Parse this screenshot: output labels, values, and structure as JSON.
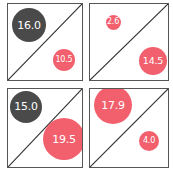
{
  "colors": {
    "dark": "#4a4a4a",
    "pink": "#f2606e",
    "border": "#555555",
    "label": "#ffffff"
  },
  "panels": [
    {
      "id": "top-left",
      "box": {
        "x": 7,
        "y": 3,
        "w": 76,
        "h": 78
      },
      "upper": {
        "value": "16.0",
        "color": "dark",
        "cx": 28,
        "cy": 24,
        "d": 34
      },
      "lower": {
        "value": "10.5",
        "color": "pink",
        "cx": 63,
        "cy": 59,
        "d": 22
      }
    },
    {
      "id": "top-right",
      "box": {
        "x": 89,
        "y": 3,
        "w": 80,
        "h": 78
      },
      "upper": {
        "value": "2.6",
        "color": "pink",
        "cx": 112,
        "cy": 21,
        "d": 15
      },
      "lower": {
        "value": "14.5",
        "color": "pink",
        "cx": 152,
        "cy": 60,
        "d": 28
      }
    },
    {
      "id": "bottom-left",
      "box": {
        "x": 7,
        "y": 88,
        "w": 76,
        "h": 80
      },
      "upper": {
        "value": "15.0",
        "color": "dark",
        "cx": 25,
        "cy": 106,
        "d": 32
      },
      "lower": {
        "value": "19.5",
        "color": "pink",
        "cx": 63,
        "cy": 138,
        "d": 42
      }
    },
    {
      "id": "bottom-right",
      "box": {
        "x": 89,
        "y": 88,
        "w": 80,
        "h": 80
      },
      "upper": {
        "value": "17.9",
        "color": "pink",
        "cx": 112,
        "cy": 104,
        "d": 38
      },
      "lower": {
        "value": "4.0",
        "color": "pink",
        "cx": 148,
        "cy": 140,
        "d": 20
      }
    }
  ]
}
